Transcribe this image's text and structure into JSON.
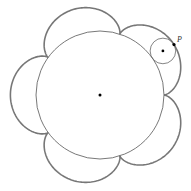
{
  "diagram": {
    "fixed_circle": {
      "cx": 100,
      "cy": 95,
      "r": 64,
      "stroke": "#555555"
    },
    "rolling_circle": {
      "r": 12.8,
      "stroke": "#666666"
    },
    "cusps": 5,
    "cusp_start_angle_deg": 0,
    "rolling_angle_deg": -35,
    "curve_stroke": "#777777",
    "point_label": "P",
    "center_dot_color": "#000000"
  }
}
